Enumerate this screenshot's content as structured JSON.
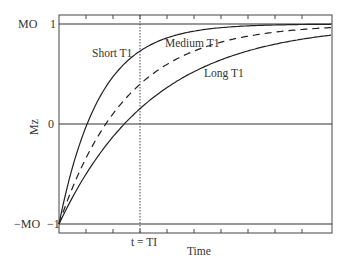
{
  "chart_data": {
    "type": "line",
    "title": "",
    "xlabel": "Time",
    "ylabel": "Mz",
    "ylim": [
      -1,
      1
    ],
    "xlim": [
      0,
      3.37
    ],
    "x_unit": "multiples of T1",
    "yticks": [
      {
        "value": 1,
        "label": "1",
        "name": "MO"
      },
      {
        "value": 0,
        "label": "0",
        "name": ""
      },
      {
        "value": -1,
        "label": "-1",
        "name": "−MO"
      }
    ],
    "x_tick_count": 9,
    "x_tick_spacing": 0.333,
    "annotations": [
      {
        "text": "t = TI",
        "x": 1.0,
        "type": "vertical-dotted-line"
      }
    ],
    "grid": false,
    "horizontal_reference_lines": [
      1,
      0,
      -1
    ],
    "x": [
      0,
      0.25,
      0.5,
      0.75,
      1.0,
      1.25,
      1.5,
      1.75,
      2.0,
      2.25,
      2.5,
      2.75,
      3.0,
      3.37
    ],
    "series": [
      {
        "name": "Short T1",
        "style": "solid",
        "rate": 2.0,
        "values": [
          -1.0,
          -0.21,
          0.26,
          0.55,
          0.73,
          0.84,
          0.9,
          0.94,
          0.96,
          0.98,
          0.99,
          0.99,
          1.0,
          1.0
        ]
      },
      {
        "name": "Medium T1",
        "style": "dashed",
        "rate": 1.2,
        "values": [
          -1.0,
          -0.48,
          -0.1,
          0.19,
          0.4,
          0.55,
          0.67,
          0.76,
          0.82,
          0.87,
          0.9,
          0.93,
          0.95,
          0.97
        ]
      },
      {
        "name": "Long T1",
        "style": "solid",
        "rate": 0.86,
        "values": [
          -1.0,
          -0.61,
          -0.3,
          -0.05,
          0.15,
          0.32,
          0.45,
          0.56,
          0.64,
          0.71,
          0.77,
          0.81,
          0.85,
          0.89
        ]
      }
    ],
    "labels": {
      "short": "Short T1",
      "medium": "Medium T1",
      "long": "Long T1",
      "ti": "t = TI",
      "mo_top": "MO",
      "mo_top_val": "1",
      "zero_val": "0",
      "mo_bottom": "−MO",
      "mo_bottom_val": "−1"
    }
  }
}
